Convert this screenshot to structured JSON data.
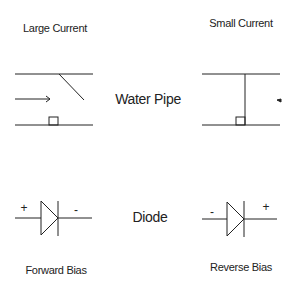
{
  "labels": {
    "large_current": "Large Current",
    "small_current": "Small Current",
    "water_pipe": "Water Pipe",
    "diode": "Diode",
    "forward_bias": "Forward Bias",
    "reverse_bias": "Reverse Bias"
  },
  "signs": {
    "forward_plus": "+",
    "forward_minus": "-",
    "reverse_minus": "-",
    "reverse_plus": "+"
  },
  "colors": {
    "stroke": "#222222",
    "background": "#ffffff"
  }
}
